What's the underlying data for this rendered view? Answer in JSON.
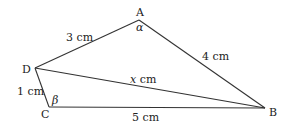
{
  "diagram": {
    "type": "quadrilateral-with-diagonal",
    "vertices": {
      "A": {
        "label": "A",
        "x": 139,
        "y": 20
      },
      "B": {
        "label": "B",
        "x": 265,
        "y": 108
      },
      "C": {
        "label": "C",
        "x": 49,
        "y": 107
      },
      "D": {
        "label": "D",
        "x": 35,
        "y": 68
      }
    },
    "edges": [
      {
        "from": "D",
        "to": "A",
        "label": "3 cm"
      },
      {
        "from": "A",
        "to": "B",
        "label": "4 cm"
      },
      {
        "from": "D",
        "to": "C",
        "label": "1 cm"
      },
      {
        "from": "C",
        "to": "B",
        "label": "5 cm"
      },
      {
        "from": "D",
        "to": "B",
        "label": "x cm",
        "label_var": "x",
        "label_unit": " cm"
      }
    ],
    "angles": [
      {
        "vertex": "A",
        "label": "α"
      },
      {
        "vertex": "C",
        "label": "β"
      }
    ]
  }
}
